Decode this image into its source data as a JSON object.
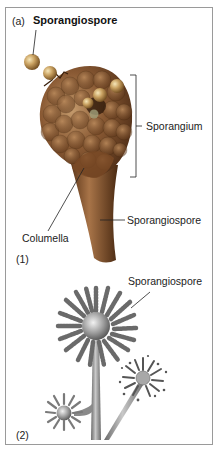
{
  "figure": {
    "panel_a_tag": "(a)",
    "title_label": "Sporangiospore",
    "part1": {
      "tag": "(1)",
      "labels": {
        "sporangium": "Sporangium",
        "stalk": "Sporangiospore",
        "columella": "Columella"
      },
      "colors": {
        "sporangium_dark": "#4a2a14",
        "sporangium_mid": "#8a5a34",
        "sporangium_light": "#c49a6c",
        "spore": "#c8a060"
      }
    },
    "part2": {
      "tag": "(2)",
      "labels": {
        "head": "Sporangiospore"
      },
      "colors": {
        "gray_dark": "#5a5a5a",
        "gray_mid": "#8a8a8a",
        "gray_light": "#cfcfcf"
      }
    },
    "frame_color": "#9a9a9a"
  }
}
